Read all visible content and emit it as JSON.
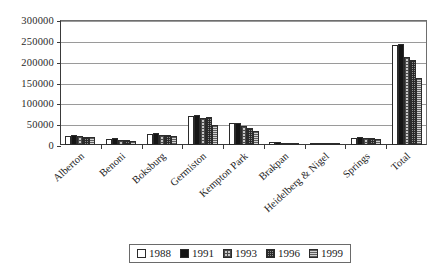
{
  "chart_data": {
    "type": "bar",
    "title": "",
    "xlabel": "",
    "ylabel": "",
    "ylim": [
      0,
      300000
    ],
    "ytick_step": 50000,
    "yticks": [
      "0",
      "50000",
      "100000",
      "150000",
      "200000",
      "250000",
      "300000"
    ],
    "grid": true,
    "legend_position": "bottom-center",
    "categories": [
      "Alberton",
      "Benoni",
      "Boksburg",
      "Germiston",
      "Kempton Park",
      "Brakpan",
      "Heidelberg & Nigel",
      "Springs",
      "Total"
    ],
    "series": [
      {
        "name": "1988",
        "color": "#ffffff",
        "pattern": "solid-white",
        "values": [
          21000,
          14000,
          26000,
          70000,
          54000,
          7000,
          4000,
          18000,
          239000
        ]
      },
      {
        "name": "1991",
        "color": "#151515",
        "pattern": "solid-black",
        "values": [
          23000,
          16000,
          28000,
          72000,
          52000,
          7000,
          5000,
          19000,
          242000
        ]
      },
      {
        "name": "1993",
        "color": "#c8c8c8",
        "pattern": "cross-hatch",
        "values": [
          21000,
          12000,
          25000,
          66000,
          45000,
          6000,
          5000,
          17000,
          212000
        ]
      },
      {
        "name": "1996",
        "color": "#8d8d8d",
        "pattern": "dense-dot",
        "values": [
          20000,
          11000,
          24000,
          67000,
          41000,
          6000,
          6000,
          16000,
          203000
        ]
      },
      {
        "name": "1999",
        "color": "#d2d2d2",
        "pattern": "horizontal-lines",
        "values": [
          20000,
          10000,
          22000,
          48000,
          33000,
          5000,
          6000,
          15000,
          160000
        ]
      }
    ]
  },
  "legend": {
    "items": [
      {
        "label": "1988"
      },
      {
        "label": "1991"
      },
      {
        "label": "1993"
      },
      {
        "label": "1996"
      },
      {
        "label": "1999"
      }
    ]
  }
}
